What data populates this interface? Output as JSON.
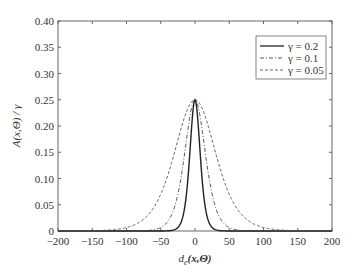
{
  "chart_data": {
    "type": "line",
    "title": "",
    "xlabel": "d_e(x,Θ)",
    "ylabel": "A(x,Θ)/γ",
    "xlim": [
      -200,
      200
    ],
    "ylim": [
      0,
      0.4
    ],
    "xticks": [
      -200,
      -150,
      -100,
      -50,
      0,
      50,
      100,
      150,
      200
    ],
    "yticks": [
      0,
      0.05,
      0.1,
      0.15,
      0.2,
      0.25,
      0.3,
      0.35,
      0.4
    ],
    "xtick_labels": [
      "−200",
      "−150",
      "−100",
      "−50",
      "0",
      "50",
      "100",
      "150",
      "200"
    ],
    "ytick_labels": [
      "0",
      "0.05",
      "0.10",
      "0.15",
      "0.20",
      "0.25",
      "0.30",
      "0.35",
      "0.40"
    ],
    "grid": false,
    "legend_position": "upper right",
    "series": [
      {
        "name": "γ = 0.2",
        "style": "solid",
        "peak": 0.25,
        "gamma": 0.2,
        "x": [
          -40,
          -25,
          -15,
          -10,
          -5,
          0,
          5,
          10,
          15,
          25,
          40
        ],
        "values": [
          0.0,
          0.003,
          0.03,
          0.08,
          0.17,
          0.25,
          0.17,
          0.08,
          0.03,
          0.003,
          0.0
        ]
      },
      {
        "name": "γ = 0.1",
        "style": "dashdot",
        "peak": 0.25,
        "gamma": 0.1,
        "x": [
          -80,
          -50,
          -30,
          -20,
          -10,
          0,
          10,
          20,
          30,
          50,
          80
        ],
        "values": [
          0.0,
          0.01,
          0.05,
          0.1,
          0.18,
          0.25,
          0.18,
          0.1,
          0.05,
          0.01,
          0.0
        ]
      },
      {
        "name": "γ = 0.05",
        "style": "dashed",
        "peak": 0.25,
        "gamma": 0.05,
        "x": [
          -150,
          -100,
          -60,
          -40,
          -20,
          0,
          20,
          40,
          60,
          100,
          150
        ],
        "values": [
          0.0,
          0.01,
          0.05,
          0.1,
          0.18,
          0.25,
          0.18,
          0.1,
          0.05,
          0.01,
          0.0
        ]
      }
    ]
  },
  "legend": {
    "items": [
      {
        "label": "γ = 0.2",
        "style": "solid"
      },
      {
        "label": "γ = 0.1",
        "style": "dashdot"
      },
      {
        "label": "γ = 0.05",
        "style": "dashed"
      }
    ]
  },
  "axes": {
    "xlabel_main": "d",
    "xlabel_sub": "e",
    "xlabel_rest": "(x,Θ)",
    "ylabel": "A(x,Θ) / γ"
  },
  "colors": {
    "axis": "#555555",
    "line": "#222222",
    "text": "#333333"
  }
}
